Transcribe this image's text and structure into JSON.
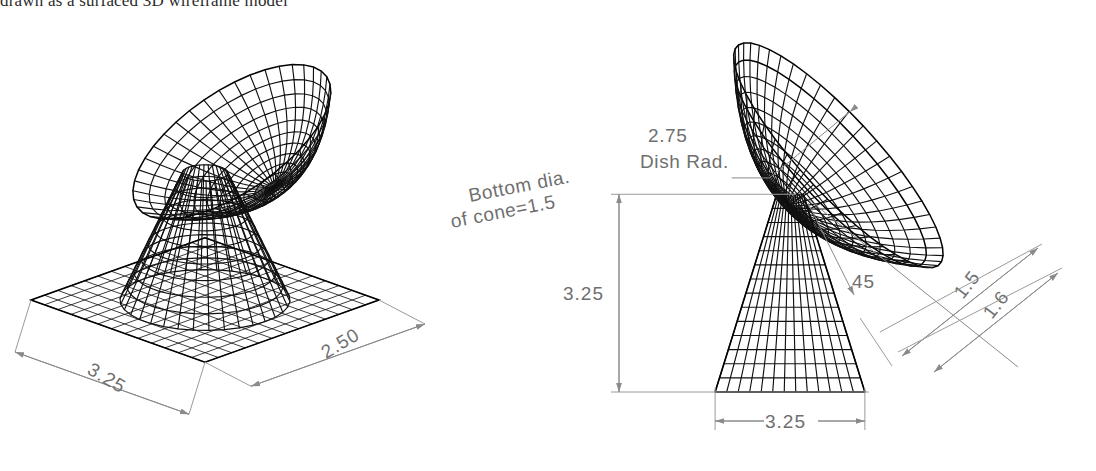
{
  "caption": {
    "text": "drawn as a surfaced 3D wireframe model"
  },
  "figures": {
    "left": {
      "name": "isometric-pictorial-view",
      "dimensions": [
        {
          "id": "base-width",
          "value": "3.25",
          "orientation": "iso-left"
        },
        {
          "id": "base-depth",
          "value": "2.50",
          "orientation": "iso-right"
        }
      ]
    },
    "right": {
      "name": "front-elevation-view",
      "notes": [
        {
          "id": "dish-radius",
          "line1": "2.75",
          "line2": "Dish Rad."
        },
        {
          "id": "cone-bottom-dia",
          "line1": "Bottom dia.",
          "line2": "of cone=1.5"
        }
      ],
      "dimensions": [
        {
          "id": "cone-height",
          "value": "3.25",
          "orientation": "vertical"
        },
        {
          "id": "cone-base-width",
          "value": "3.25",
          "orientation": "horizontal"
        },
        {
          "id": "dish-angle",
          "value": "45",
          "orientation": "angle"
        },
        {
          "id": "rim-offset-a",
          "value": "1.5",
          "orientation": "diagonal"
        },
        {
          "id": "rim-offset-b",
          "value": "1.6",
          "orientation": "diagonal"
        }
      ]
    }
  },
  "colors": {
    "wireframe": "#111111",
    "dimension_line": "#8a8a8a",
    "dimension_text": "#6f6f6f",
    "caption_text": "#2b2b2b",
    "background": "#ffffff"
  }
}
